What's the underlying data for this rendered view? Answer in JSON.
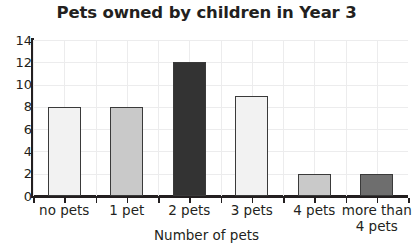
{
  "chart_data": {
    "type": "bar",
    "title": "Pets owned by children in Year 3",
    "xlabel": "Number of pets",
    "ylabel": "",
    "categories": [
      "no pets",
      "1 pet",
      "2 pets",
      "3 pets",
      "4 pets",
      "more than\n4 pets"
    ],
    "values": [
      8,
      8,
      12,
      9,
      2,
      2
    ],
    "bar_colors": [
      "#f2f2f2",
      "#c9c9c9",
      "#333333",
      "#f2f2f2",
      "#c9c9c9",
      "#6e6e6e"
    ],
    "bar_border_color": "#3a3a3a",
    "ylim": [
      0,
      14
    ],
    "ytick_labels": [
      "0",
      "2",
      "4",
      "6",
      "8",
      "10",
      "12",
      "14"
    ],
    "ytick_values": [
      0,
      2,
      4,
      6,
      8,
      10,
      12,
      14
    ],
    "grid": true,
    "grid_color": "#ececed",
    "legend": "none",
    "axis_color": "#231f20"
  }
}
